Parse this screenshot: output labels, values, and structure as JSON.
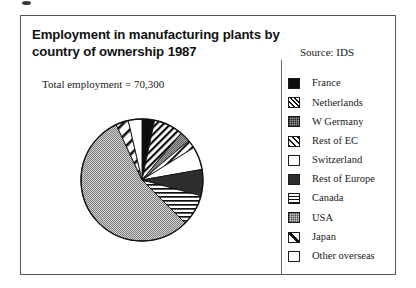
{
  "figure": {
    "title_line1": "Employment in manufacturing plants by",
    "title_line2": "country of ownership 1987",
    "source": "Source: IDS",
    "total_label": "Total employment = 70,300"
  },
  "legend": {
    "items": [
      {
        "label": "France",
        "pattern": "solid-black",
        "swatch_class": "sw-black"
      },
      {
        "label": "Netherlands",
        "pattern": "diagonal-dense",
        "swatch_class": "sw-hatch-dense"
      },
      {
        "label": "W Germany",
        "pattern": "grey-dotted",
        "swatch_class": "sw-grey-dot"
      },
      {
        "label": "Rest of EC",
        "pattern": "diagonal-medium",
        "swatch_class": "sw-hatch-med"
      },
      {
        "label": "Switzerland",
        "pattern": "white",
        "swatch_class": "sw-white"
      },
      {
        "label": "Rest of Europe",
        "pattern": "dark-grey",
        "swatch_class": "sw-darkgrey"
      },
      {
        "label": "Canada",
        "pattern": "horizontal-lines",
        "swatch_class": "sw-hline"
      },
      {
        "label": "USA",
        "pattern": "light-checker",
        "swatch_class": "sw-lightcheck"
      },
      {
        "label": "Japan",
        "pattern": "single-diagonal",
        "swatch_class": "sw-diag1"
      },
      {
        "label": "Other overseas",
        "pattern": "white",
        "swatch_class": "sw-white"
      }
    ]
  },
  "chart_data": {
    "type": "pie",
    "title": "Employment in manufacturing plants by country of ownership 1987",
    "subtitle": "Total employment = 70,300",
    "source": "Source: IDS",
    "total_employment": 70300,
    "units": "employees",
    "legend_position": "right",
    "start_angle_deg": 0,
    "direction": "clockwise",
    "categories": [
      "France",
      "Netherlands",
      "W Germany",
      "Rest of EC",
      "Switzerland",
      "Rest of Europe",
      "Canada",
      "USA",
      "Japan",
      "Other overseas"
    ],
    "angles_deg": [
      12,
      28,
      10,
      8,
      22,
      25,
      30,
      200,
      12,
      13
    ],
    "percent": [
      3.3,
      7.8,
      2.8,
      2.2,
      6.1,
      6.9,
      8.3,
      55.6,
      3.3,
      3.6
    ],
    "values": [
      2320,
      5480,
      1950,
      1560,
      4290,
      4880,
      5840,
      39090,
      2320,
      2540
    ]
  },
  "colors": {
    "frame_border": "#555555",
    "ink": "#1a1a1a",
    "pie_outline": "#111111",
    "usa_fill": "#cfcfcf",
    "w_germany_fill": "#9a9a9a",
    "france_fill": "#0d0d0d",
    "rest_of_europe_fill": "#2e2e2e"
  }
}
